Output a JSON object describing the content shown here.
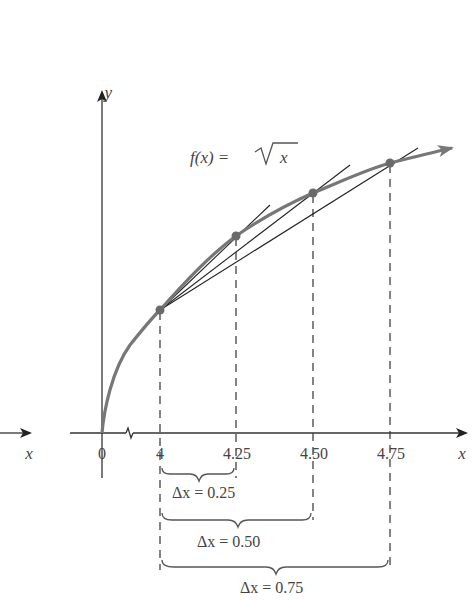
{
  "diagram": {
    "function_label": "f(x) = √x",
    "function_prefix": "f(x) = ",
    "function_radicand": "x",
    "y_axis_label": "y",
    "x_axis_label": "x",
    "left_x_label": "x",
    "origin_label": "0",
    "tick_labels": [
      "4",
      "4.25",
      "4.50",
      "4.75"
    ],
    "delta_labels": [
      "Δx = 0.25",
      "Δx = 0.50",
      "Δx = 0.75"
    ],
    "points": [
      {
        "x": 4,
        "label": "4"
      },
      {
        "x": 4.25,
        "label": "4.25"
      },
      {
        "x": 4.5,
        "label": "4.50"
      },
      {
        "x": 4.75,
        "label": "4.75"
      }
    ],
    "colors": {
      "curve": "#777777",
      "axis": "#333333",
      "secant": "#222222",
      "point": "#6a6a6a",
      "text": "#444444"
    }
  }
}
